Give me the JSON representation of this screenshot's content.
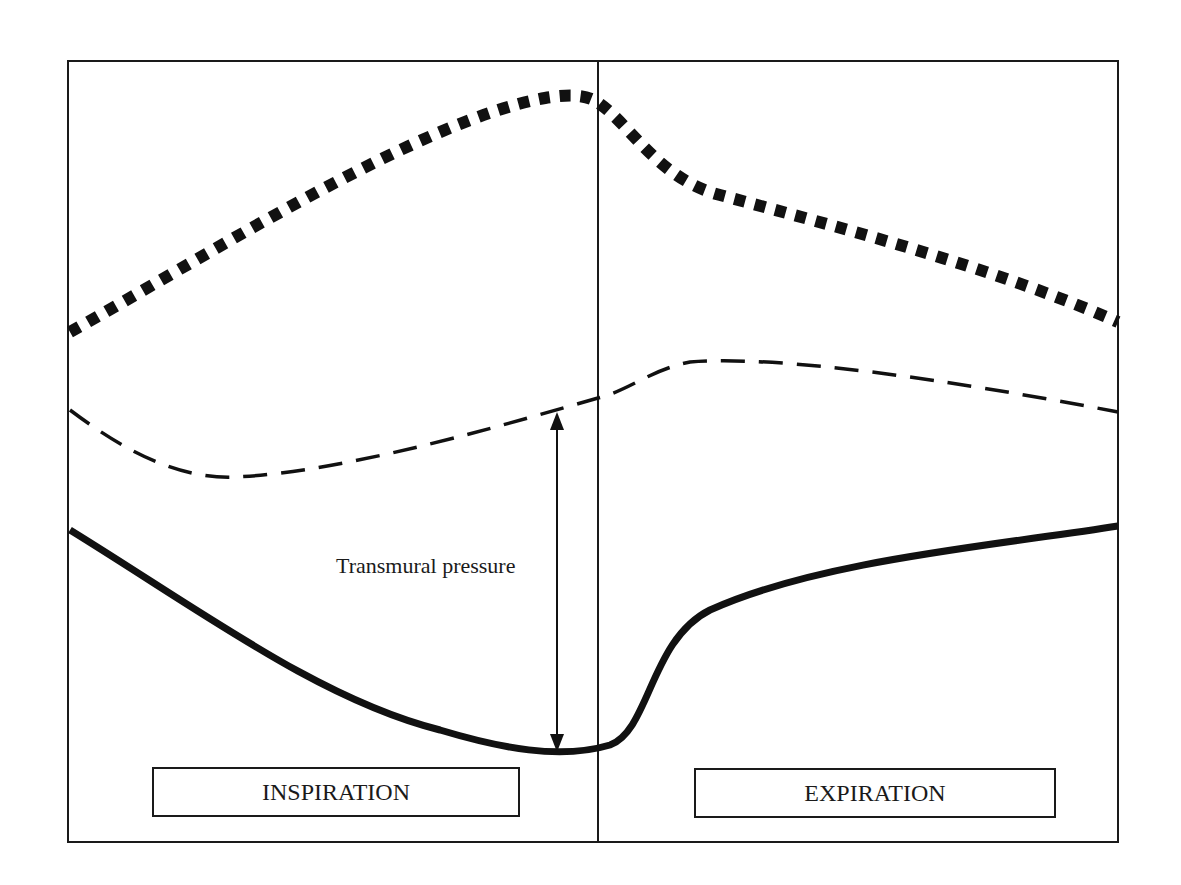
{
  "diagram": {
    "annotation": "Transmural pressure",
    "phases": {
      "inspiration": "INSPIRATION",
      "expiration": "EXPIRATION"
    },
    "curves": [
      {
        "name": "dotted-thick-curve",
        "style": "dotted",
        "color": "#111111"
      },
      {
        "name": "dashed-curve",
        "style": "dashed",
        "color": "#111111"
      },
      {
        "name": "solid-thick-curve",
        "style": "solid",
        "color": "#111111"
      }
    ],
    "colors": {
      "line": "#111111",
      "frame": "#1a1a1a",
      "background": "#ffffff"
    }
  }
}
